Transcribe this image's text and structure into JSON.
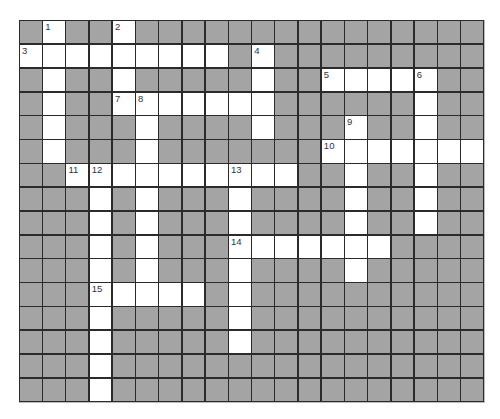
{
  "puzzle": {
    "rows": 16,
    "cols": 20,
    "colors": {
      "block": "#a4a4a4",
      "open": "#ffffff",
      "gridline": "#2b2b2b",
      "number": "#333333"
    },
    "open_cells": {
      "0": [
        1,
        4
      ],
      "1": [
        0,
        1,
        2,
        3,
        4,
        5,
        6,
        7,
        8,
        10
      ],
      "2": [
        1,
        4,
        10,
        13,
        14,
        15,
        16,
        17
      ],
      "3": [
        1,
        4,
        5,
        6,
        7,
        8,
        9,
        10,
        17
      ],
      "4": [
        1,
        5,
        10,
        14,
        17
      ],
      "5": [
        1,
        5,
        13,
        14,
        15,
        16,
        17,
        18,
        19
      ],
      "6": [
        2,
        3,
        4,
        5,
        6,
        7,
        8,
        9,
        10,
        11,
        14,
        17
      ],
      "7": [
        3,
        5,
        9,
        14,
        17
      ],
      "8": [
        3,
        5,
        9,
        14,
        17
      ],
      "9": [
        3,
        5,
        9,
        10,
        11,
        12,
        13,
        14,
        15
      ],
      "10": [
        3,
        5,
        9,
        14
      ],
      "11": [
        3,
        4,
        5,
        6,
        7,
        9
      ],
      "12": [
        3,
        9
      ],
      "13": [
        3,
        9
      ],
      "14": [
        3
      ],
      "15": [
        3
      ]
    },
    "numbers": [
      {
        "label": "1",
        "row": 0,
        "col": 1
      },
      {
        "label": "2",
        "row": 0,
        "col": 4
      },
      {
        "label": "3",
        "row": 1,
        "col": 0
      },
      {
        "label": "4",
        "row": 1,
        "col": 10
      },
      {
        "label": "5",
        "row": 2,
        "col": 13
      },
      {
        "label": "6",
        "row": 2,
        "col": 17
      },
      {
        "label": "7",
        "row": 3,
        "col": 4
      },
      {
        "label": "8",
        "row": 3,
        "col": 5
      },
      {
        "label": "9",
        "row": 4,
        "col": 14
      },
      {
        "label": "10",
        "row": 5,
        "col": 13
      },
      {
        "label": "11",
        "row": 6,
        "col": 2
      },
      {
        "label": "12",
        "row": 6,
        "col": 3
      },
      {
        "label": "13",
        "row": 6,
        "col": 9
      },
      {
        "label": "14",
        "row": 9,
        "col": 9
      },
      {
        "label": "15",
        "row": 11,
        "col": 3
      }
    ],
    "entries": {
      "across": [
        {
          "label": "3",
          "row": 1,
          "col": 0,
          "length": 9
        },
        {
          "label": "5",
          "row": 2,
          "col": 13,
          "length": 5
        },
        {
          "label": "7",
          "row": 3,
          "col": 4,
          "length": 7
        },
        {
          "label": "10",
          "row": 5,
          "col": 13,
          "length": 7
        },
        {
          "label": "11",
          "row": 6,
          "col": 2,
          "length": 10
        },
        {
          "label": "14",
          "row": 9,
          "col": 9,
          "length": 7
        },
        {
          "label": "15",
          "row": 11,
          "col": 3,
          "length": 5
        }
      ],
      "down": [
        {
          "label": "1",
          "row": 0,
          "col": 1,
          "length": 6
        },
        {
          "label": "2",
          "row": 0,
          "col": 4,
          "length": 4
        },
        {
          "label": "4",
          "row": 1,
          "col": 10,
          "length": 4
        },
        {
          "label": "6",
          "row": 2,
          "col": 17,
          "length": 7
        },
        {
          "label": "8",
          "row": 3,
          "col": 5,
          "length": 9
        },
        {
          "label": "9",
          "row": 4,
          "col": 14,
          "length": 7
        },
        {
          "label": "12",
          "row": 6,
          "col": 3,
          "length": 10
        },
        {
          "label": "13",
          "row": 6,
          "col": 9,
          "length": 8
        }
      ]
    }
  }
}
